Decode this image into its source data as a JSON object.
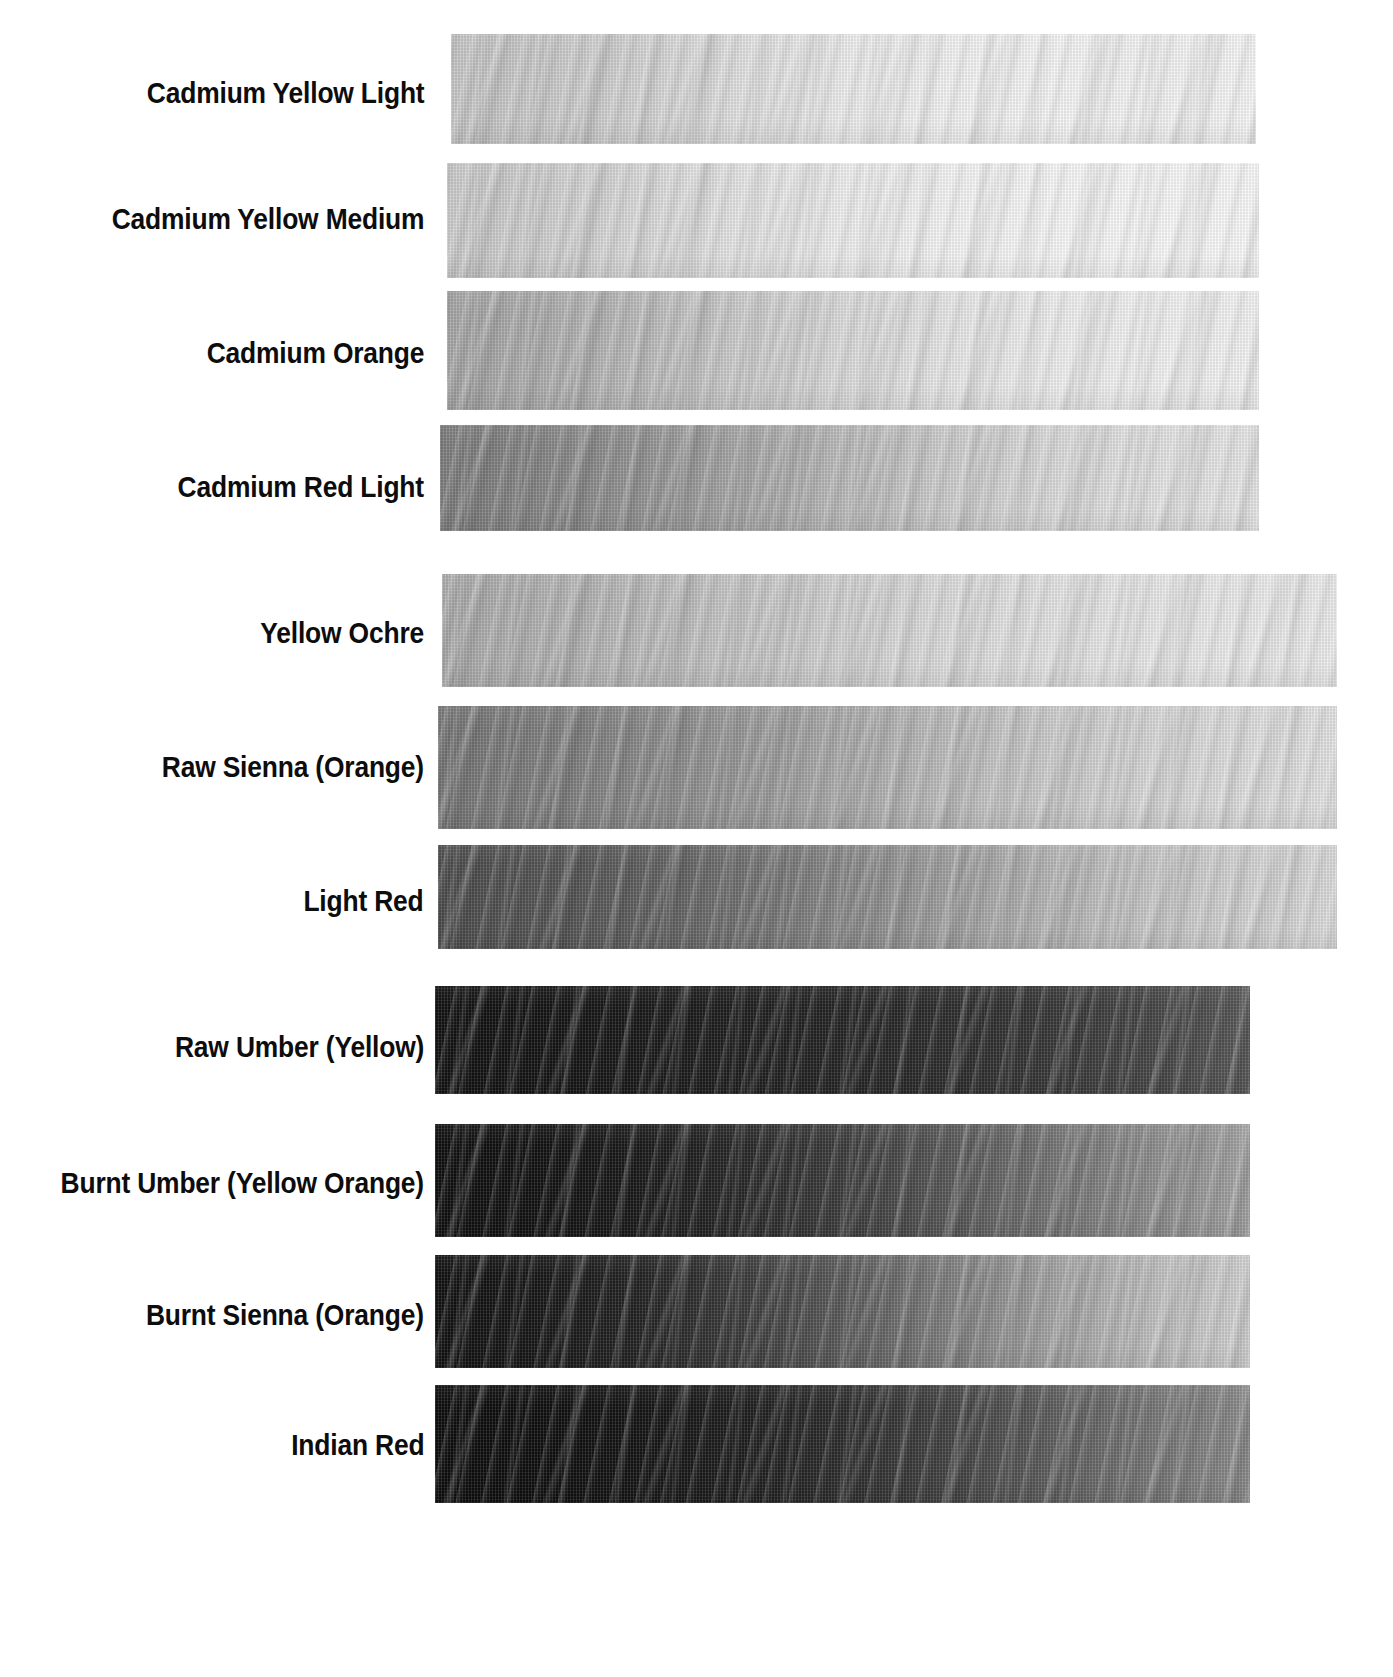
{
  "page": {
    "background": "#ffffff",
    "width": 1393,
    "height": 1677,
    "label_color": "#0d0d0d"
  },
  "chart_data": {
    "type": "heatmap",
    "title": "",
    "xlabel": "",
    "ylabel": "",
    "value_axis": "Grayscale luminance 0 (black) to 255 (white), left-to-right across each strip",
    "groups": [
      {
        "name": "Cadmium family",
        "rows": [
          0,
          1,
          2,
          3
        ]
      },
      {
        "name": "Earth yellows and reds",
        "rows": [
          4,
          5,
          6
        ]
      },
      {
        "name": "Umbers and dark earths",
        "rows": [
          7,
          8,
          9,
          10
        ]
      }
    ],
    "categories": [
      "Cadmium Yellow Light",
      "Cadmium Yellow Medium",
      "Cadmium Orange",
      "Cadmium Red Light",
      "Yellow Ochre",
      "Raw Sienna (Orange)",
      "Light Red",
      "Raw Umber (Yellow)",
      "Burnt Umber (Yellow Orange)",
      "Burnt Sienna (Orange)",
      "Indian Red"
    ],
    "series": [
      {
        "name": "left_value",
        "values": [
          200,
          206,
          170,
          132,
          176,
          126,
          86,
          22,
          20,
          24,
          18
        ]
      },
      {
        "name": "mid_value",
        "values": [
          222,
          228,
          206,
          176,
          202,
          170,
          140,
          40,
          58,
          76,
          48
        ]
      },
      {
        "name": "right_value",
        "values": [
          247,
          250,
          243,
          232,
          236,
          228,
          224,
          96,
          178,
          228,
          150
        ]
      }
    ]
  },
  "swatches": [
    {
      "label": "Cadmium Yellow Light",
      "label_top": 78,
      "x": 451,
      "y": 34,
      "w": 805,
      "h": 110,
      "stops": [
        "#c9c9c9",
        "#cdcdcd",
        "#d6d6d6",
        "#e4e4e4",
        "#efefef",
        "#f4f4f4",
        "#f7f7f7",
        "#f4f4f4",
        "#f8f8f8"
      ]
    },
    {
      "label": "Cadmium Yellow Medium",
      "label_top": 204,
      "x": 447,
      "y": 163,
      "w": 812,
      "h": 115,
      "stops": [
        "#cecece",
        "#d2d2d2",
        "#dcdcdc",
        "#e8e8e8",
        "#f1f1f1",
        "#f6f6f6",
        "#f9f9f9",
        "#fafafa",
        "#fbfbfb"
      ]
    },
    {
      "label": "Cadmium Orange",
      "label_top": 338,
      "x": 447,
      "y": 291,
      "w": 812,
      "h": 119,
      "stops": [
        "#a8a8a8",
        "#b0b0b0",
        "#bebebe",
        "#cfcfcf",
        "#dedede",
        "#e9e9e9",
        "#f0f0f0",
        "#f3f3f3",
        "#f4f4f4"
      ]
    },
    {
      "label": "Cadmium Red Light",
      "label_top": 472,
      "x": 440,
      "y": 425,
      "w": 819,
      "h": 106,
      "stops": [
        "#7f7f7f",
        "#888888",
        "#969696",
        "#a9a9a9",
        "#bdbdbd",
        "#cfcfcf",
        "#dcdcdc",
        "#e4e4e4",
        "#e8e8e8"
      ]
    },
    {
      "label": "Yellow Ochre",
      "label_top": 618,
      "x": 442,
      "y": 574,
      "w": 895,
      "h": 113,
      "stops": [
        "#aeaeae",
        "#b4b4b4",
        "#bfbfbf",
        "#cccccc",
        "#d9d9d9",
        "#e2e2e2",
        "#e8e8e8",
        "#ececec",
        "#ededed"
      ]
    },
    {
      "label": "Raw Sienna (Orange)",
      "label_top": 752,
      "x": 438,
      "y": 706,
      "w": 899,
      "h": 123,
      "stops": [
        "#787878",
        "#808080",
        "#8e8e8e",
        "#a0a0a0",
        "#b4b4b4",
        "#c6c6c6",
        "#d4d4d4",
        "#dedede",
        "#e4e4e4"
      ]
    },
    {
      "label": "Light Red",
      "label_top": 886,
      "x": 438,
      "y": 845,
      "w": 899,
      "h": 104,
      "stops": [
        "#4e4e4e",
        "#565656",
        "#646464",
        "#7a7a7a",
        "#949494",
        "#adadad",
        "#c2c2c2",
        "#d2d2d2",
        "#dcdcdc"
      ]
    },
    {
      "label": "Raw Umber (Yellow)",
      "label_top": 1032,
      "x": 435,
      "y": 986,
      "w": 815,
      "h": 108,
      "stops": [
        "#131313",
        "#151515",
        "#1a1a1a",
        "#202020",
        "#262626",
        "#2e2e2e",
        "#383838",
        "#474747",
        "#595959"
      ]
    },
    {
      "label": "Burnt Umber (Yellow Orange)",
      "label_top": 1168,
      "x": 435,
      "y": 1124,
      "w": 815,
      "h": 113,
      "stops": [
        "#101010",
        "#131313",
        "#1b1b1b",
        "#292929",
        "#3d3d3d",
        "#585858",
        "#757575",
        "#8f8f8f",
        "#a4a4a4"
      ]
    },
    {
      "label": "Burnt Sienna (Orange)",
      "label_top": 1300,
      "x": 435,
      "y": 1255,
      "w": 815,
      "h": 113,
      "stops": [
        "#121212",
        "#181818",
        "#252525",
        "#3c3c3c",
        "#5c5c5c",
        "#808080",
        "#a3a3a3",
        "#bfbfbf",
        "#d2d2d2"
      ]
    },
    {
      "label": "Indian Red",
      "label_top": 1430,
      "x": 435,
      "y": 1385,
      "w": 815,
      "h": 118,
      "stops": [
        "#0e0e0e",
        "#101010",
        "#161616",
        "#1f1f1f",
        "#2e2e2e",
        "#434343",
        "#5e5e5e",
        "#787878",
        "#8c8c8c"
      ]
    }
  ]
}
